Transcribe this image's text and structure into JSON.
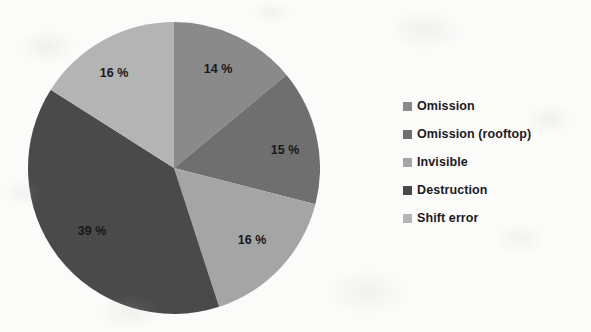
{
  "chart_data": {
    "type": "pie",
    "title": "",
    "subtitle": "",
    "xlabel": "",
    "ylabel": "",
    "grid": false,
    "legend_position": "right",
    "units": "%",
    "start_angle_deg": 0,
    "direction": "clockwise",
    "categories": [
      "Omission",
      "Omission (rooftop)",
      "Invisible",
      "Destruction",
      "Shift error"
    ],
    "values": [
      14,
      15,
      16,
      39,
      16
    ],
    "colors": [
      "#8a8a8a",
      "#6f6f6f",
      "#a5a5a5",
      "#4a4a4a",
      "#b4b4b4"
    ],
    "slices": [
      {
        "label": "Omission",
        "value": 14,
        "data_label": "14 %",
        "color": "#8a8a8a",
        "start_angle_deg": 0,
        "end_angle_deg": 50.4,
        "label_x": 218,
        "label_y": 70
      },
      {
        "label": "Omission (rooftop)",
        "value": 15,
        "data_label": "15 %",
        "color": "#6f6f6f",
        "start_angle_deg": 50.4,
        "end_angle_deg": 104.4,
        "label_x": 285,
        "label_y": 151
      },
      {
        "label": "Invisible",
        "value": 16,
        "data_label": "16 %",
        "color": "#a5a5a5",
        "start_angle_deg": 104.4,
        "end_angle_deg": 162.0,
        "label_x": 252,
        "label_y": 241
      },
      {
        "label": "Destruction",
        "value": 39,
        "data_label": "39 %",
        "color": "#4a4a4a",
        "start_angle_deg": 162.0,
        "end_angle_deg": 302.4,
        "label_x": 92,
        "label_y": 232
      },
      {
        "label": "Shift error",
        "value": 16,
        "data_label": "16 %",
        "color": "#b4b4b4",
        "start_angle_deg": 302.4,
        "end_angle_deg": 360.0,
        "label_x": 114,
        "label_y": 74
      }
    ]
  },
  "legend": {
    "items": [
      {
        "label": "Omission",
        "color": "#8a8a8a"
      },
      {
        "label": "Omission (rooftop)",
        "color": "#6f6f6f"
      },
      {
        "label": "Invisible",
        "color": "#a5a5a5"
      },
      {
        "label": "Destruction",
        "color": "#4a4a4a"
      },
      {
        "label": "Shift error",
        "color": "#b4b4b4"
      }
    ]
  }
}
